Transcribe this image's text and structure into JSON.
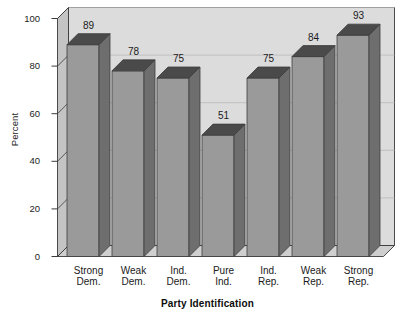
{
  "chart_data": {
    "type": "bar",
    "title": "",
    "subtitle": "",
    "xlabel": "Party Identification",
    "ylabel": "Percent",
    "categories": [
      "Strong Dem.",
      "Weak Dem.",
      "Ind. Dem.",
      "Pure Ind.",
      "Ind. Rep.",
      "Weak Rep.",
      "Strong Rep."
    ],
    "category_lines": [
      [
        "Strong",
        "Dem."
      ],
      [
        "Weak",
        "Dem."
      ],
      [
        "Ind.",
        "Dem."
      ],
      [
        "Pure",
        "Ind."
      ],
      [
        "Ind.",
        "Rep."
      ],
      [
        "Weak",
        "Rep."
      ],
      [
        "Strong",
        "Rep."
      ]
    ],
    "values": [
      89,
      78,
      75,
      51,
      75,
      84,
      93
    ],
    "value_labels": [
      "89",
      "78",
      "75",
      "51",
      "75",
      "84",
      "93"
    ],
    "ylim": [
      0,
      100
    ],
    "yticks": [
      0,
      20,
      40,
      60,
      80,
      100
    ],
    "ytick_labels": [
      "0",
      "20",
      "40",
      "60",
      "80",
      "100"
    ],
    "grid": true,
    "grid_axis": "y",
    "legend": false,
    "legend_position": "none",
    "style": "3d-column",
    "colors": {
      "bar_front": "#9a9a9a",
      "bar_side": "#6e6e6e",
      "bar_top": "#4a4a4a",
      "plot_background": "#dcdcdc",
      "plot_wall_side": "#c4c4c4",
      "plot_floor": "#cfcfcf",
      "gridline": "#b7b7b7",
      "axis_line": "#3a3a3a",
      "text": "#1a1a1a",
      "page_background": "#ffffff"
    }
  },
  "axes": {
    "y_title": "Percent",
    "x_title": "Party Identification"
  }
}
